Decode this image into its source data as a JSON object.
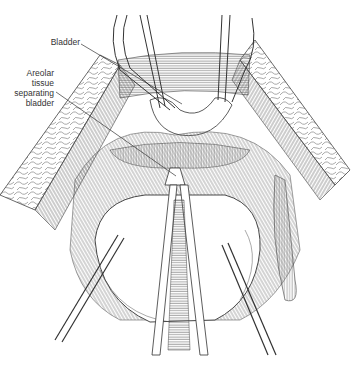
{
  "figure": {
    "stroke_color": "#3a3a3a",
    "background": "#ffffff"
  },
  "labels": [
    {
      "id": "bladder",
      "text": "Bladder",
      "leader_from": [
        81,
        44
      ],
      "leader_to": [
        182,
        104
      ]
    },
    {
      "id": "areolar-tissue",
      "lines": [
        "Areolar",
        "tissue",
        "separating",
        "bladder"
      ],
      "leader_from": [
        56,
        92
      ],
      "leader_to": [
        176,
        176
      ]
    }
  ]
}
